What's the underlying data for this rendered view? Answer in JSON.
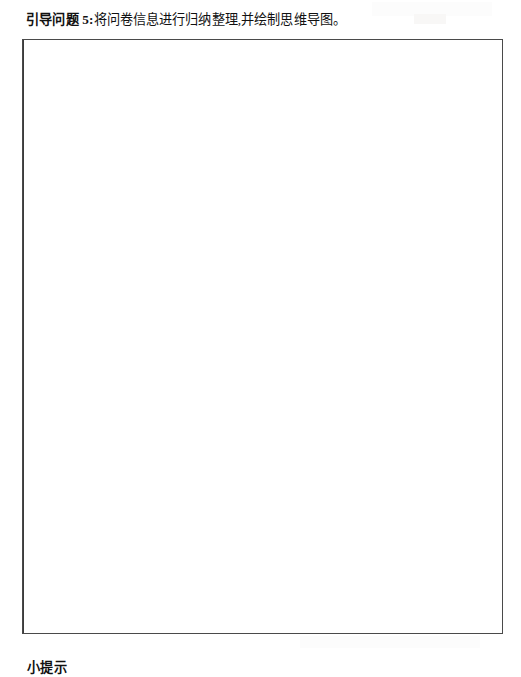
{
  "page": {
    "background_color": "#ffffff",
    "text_color": "#111111",
    "border_color": "#4a4a4a"
  },
  "question": {
    "label": "引导问题 5:",
    "text": "将问卷信息进行归纳整理,并绘制思维导图。"
  },
  "answer_box": {
    "content": "",
    "placeholder": ""
  },
  "tip": {
    "heading": "小提示"
  }
}
